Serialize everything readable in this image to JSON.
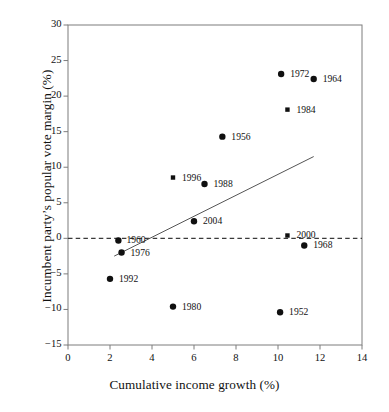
{
  "chart_data": {
    "type": "scatter",
    "title": "",
    "xlabel": "Cumulative income growth (%)",
    "ylabel": "Incumbent party’s popular vote margin (%)",
    "xlim": [
      0,
      14
    ],
    "ylim": [
      -15,
      30
    ],
    "xticks": [
      0,
      2,
      4,
      6,
      8,
      10,
      12,
      14
    ],
    "yticks": [
      -15,
      -10,
      -5,
      0,
      5,
      10,
      15,
      20,
      25,
      30
    ],
    "xtick_labels": [
      "0",
      "2",
      "4",
      "6",
      "8",
      "10",
      "12",
      "14"
    ],
    "ytick_labels": [
      "−15",
      "−10",
      "−5",
      "0",
      "5",
      "10",
      "15",
      "20",
      "25",
      "30"
    ],
    "grid": false,
    "legend": "none",
    "zero_line": {
      "y": 0,
      "style": "dashed",
      "color": "#3a3a3a"
    },
    "trend_line": {
      "style": "solid",
      "color": "#555555",
      "x_start": 2.2,
      "y_start": -2.5,
      "x_end": 11.7,
      "y_end": 11.5
    },
    "points": [
      {
        "label": "1952",
        "x": 10.1,
        "y": -10.4,
        "marker": "circle",
        "label_dx": 9,
        "label_dy": 0
      },
      {
        "label": "1956",
        "x": 7.35,
        "y": 14.3,
        "marker": "circle",
        "label_dx": 9,
        "label_dy": 0
      },
      {
        "label": "1960",
        "x": 2.4,
        "y": -0.3,
        "marker": "circle",
        "label_dx": 8,
        "label_dy": 0
      },
      {
        "label": "1964",
        "x": 11.7,
        "y": 22.4,
        "marker": "circle",
        "label_dx": 9,
        "label_dy": 0
      },
      {
        "label": "1968",
        "x": 11.25,
        "y": -1.0,
        "marker": "circle",
        "label_dx": 9,
        "label_dy": 0
      },
      {
        "label": "1972",
        "x": 10.15,
        "y": 23.1,
        "marker": "circle",
        "label_dx": 9,
        "label_dy": 0
      },
      {
        "label": "1976",
        "x": 2.55,
        "y": -2.0,
        "marker": "circle",
        "label_dx": 9,
        "label_dy": 0
      },
      {
        "label": "1980",
        "x": 5.0,
        "y": -9.6,
        "marker": "circle",
        "label_dx": 9,
        "label_dy": 0
      },
      {
        "label": "1984",
        "x": 10.45,
        "y": 18.1,
        "marker": "square",
        "label_dx": 9,
        "label_dy": 0
      },
      {
        "label": "1988",
        "x": 6.5,
        "y": 7.65,
        "marker": "circle",
        "label_dx": 9,
        "label_dy": 0
      },
      {
        "label": "1992",
        "x": 2.0,
        "y": -5.7,
        "marker": "circle",
        "label_dx": 9,
        "label_dy": 0
      },
      {
        "label": "1996",
        "x": 5.0,
        "y": 8.55,
        "marker": "square",
        "label_dx": 9,
        "label_dy": 0
      },
      {
        "label": "2000",
        "x": 10.45,
        "y": 0.4,
        "marker": "square",
        "label_dx": 9,
        "label_dy": 0
      },
      {
        "label": "2004",
        "x": 6.0,
        "y": 2.4,
        "marker": "circle",
        "label_dx": 9,
        "label_dy": 0
      }
    ]
  },
  "colors": {
    "marker": "#101010",
    "axis": "#7d7d7d",
    "trend": "#555555",
    "zero_line": "#3a3a3a",
    "text": "#111111",
    "background": "#ffffff"
  },
  "geometry": {
    "plot_left": 68,
    "plot_right": 362,
    "plot_top": 25,
    "plot_bottom": 345
  }
}
